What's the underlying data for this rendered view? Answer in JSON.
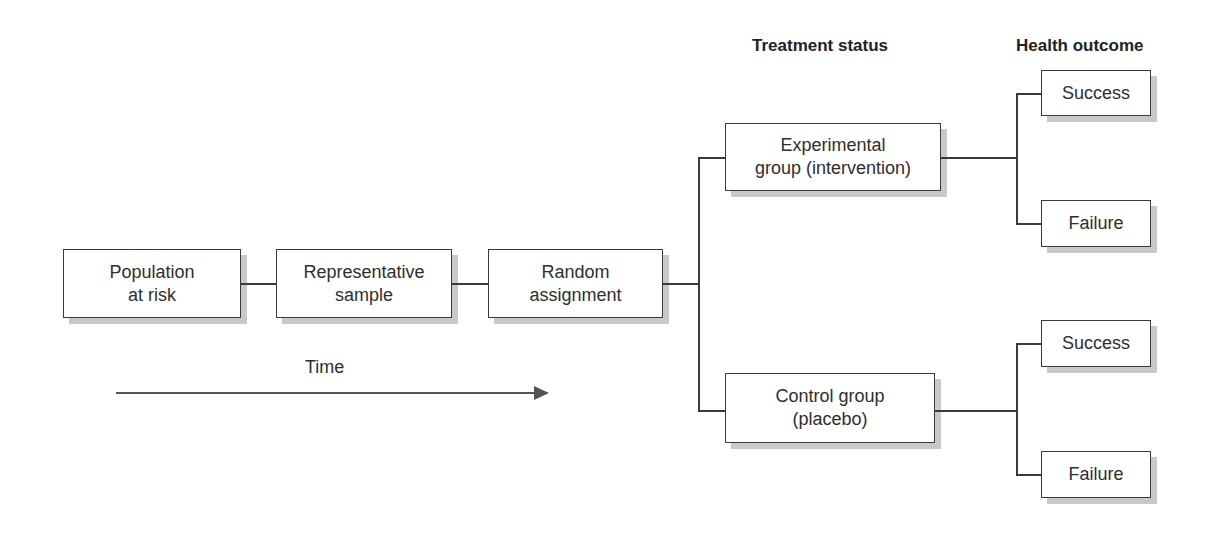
{
  "headers": {
    "treatment_status": "Treatment status",
    "health_outcome": "Health outcome"
  },
  "nodes": {
    "population": "Population\nat risk",
    "sample": "Representative\nsample",
    "random": "Random\nassignment",
    "experimental": "Experimental\ngroup (intervention)",
    "control": "Control group\n(placebo)",
    "exp_success": "Success",
    "exp_failure": "Failure",
    "ctrl_success": "Success",
    "ctrl_failure": "Failure"
  },
  "time_axis": {
    "label": "Time",
    "direction": "left-to-right"
  },
  "colors": {
    "border": "#3a3a3a",
    "shadow": "#c9c9c9",
    "arrow": "#555555"
  }
}
